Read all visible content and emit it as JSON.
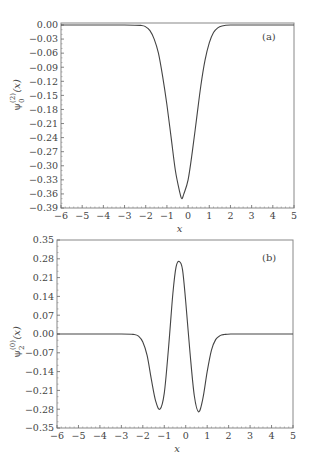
{
  "chart_data": [
    {
      "type": "line",
      "panel_label": "(a)",
      "title": "",
      "xlabel": "x",
      "ylabel": "ψ0(2) (x)",
      "ylabel_main": "ψ",
      "ylabel_sup": "(2)",
      "ylabel_sub": "0",
      "ylabel_arg": "(x)",
      "xlim": [
        -6,
        5
      ],
      "ylim": [
        -0.39,
        0.0
      ],
      "grid": false,
      "x_ticks": [
        -6,
        -5,
        -4,
        -3,
        -2,
        -1,
        0,
        1,
        2,
        3,
        4,
        5
      ],
      "x_tick_labels": [
        "−6",
        "−5",
        "−4",
        "−3",
        "−2",
        "−1",
        "0",
        "1",
        "2",
        "3",
        "4",
        "5"
      ],
      "y_ticks": [
        0.0,
        -0.03,
        -0.06,
        -0.09,
        -0.12,
        -0.15,
        -0.18,
        -0.21,
        -0.24,
        -0.27,
        -0.3,
        -0.33,
        -0.36,
        -0.39
      ],
      "y_tick_labels": [
        "0.00",
        "−0.03",
        "−0.06",
        "−0.09",
        "−0.12",
        "−0.15",
        "−0.18",
        "−0.21",
        "−0.24",
        "−0.27",
        "−0.30",
        "−0.33",
        "−0.36",
        "−0.39"
      ],
      "series": [
        {
          "name": "psi0_2",
          "x": [
            -6,
            -3,
            -2.2,
            -2.0,
            -1.8,
            -1.6,
            -1.4,
            -1.2,
            -1.0,
            -0.8,
            -0.6,
            -0.4,
            -0.3,
            -0.2,
            0.0,
            0.2,
            0.4,
            0.6,
            0.8,
            1.0,
            1.2,
            1.4,
            1.6,
            2.0,
            3,
            5
          ],
          "y": [
            0.0,
            0.0,
            -0.001,
            -0.004,
            -0.012,
            -0.03,
            -0.06,
            -0.11,
            -0.17,
            -0.24,
            -0.31,
            -0.355,
            -0.37,
            -0.36,
            -0.33,
            -0.27,
            -0.2,
            -0.13,
            -0.075,
            -0.038,
            -0.016,
            -0.006,
            -0.002,
            0.0,
            0.0,
            0.0
          ]
        }
      ]
    },
    {
      "type": "line",
      "panel_label": "(b)",
      "title": "",
      "xlabel": "x",
      "ylabel": "ψ2(0) (x)",
      "ylabel_main": "ψ",
      "ylabel_sup": "(0)",
      "ylabel_sub": "2",
      "ylabel_arg": "(x)",
      "xlim": [
        -6,
        5
      ],
      "ylim": [
        -0.35,
        0.35
      ],
      "grid": false,
      "x_ticks": [
        -6,
        -5,
        -4,
        -3,
        -2,
        -1,
        0,
        1,
        2,
        3,
        4,
        5
      ],
      "x_tick_labels": [
        "−6",
        "−5",
        "−4",
        "−3",
        "−2",
        "−1",
        "0",
        "1",
        "2",
        "3",
        "4",
        "5"
      ],
      "y_ticks": [
        0.35,
        0.28,
        0.21,
        0.14,
        0.07,
        0.0,
        -0.07,
        -0.14,
        -0.21,
        -0.28,
        -0.35
      ],
      "y_tick_labels": [
        "0.35",
        "0.28",
        "0.21",
        "0.14",
        "0.07",
        "0.00",
        "−0.07",
        "−0.14",
        "−0.21",
        "−0.28",
        "−0.35"
      ],
      "series": [
        {
          "name": "psi2_0",
          "x": [
            -6,
            -3,
            -2.4,
            -2.2,
            -2.0,
            -1.8,
            -1.6,
            -1.4,
            -1.2,
            -1.0,
            -0.8,
            -0.6,
            -0.45,
            -0.3,
            -0.15,
            0.0,
            0.2,
            0.4,
            0.6,
            0.8,
            1.0,
            1.2,
            1.4,
            1.6,
            1.8,
            2.1,
            3,
            5
          ],
          "y": [
            0.0,
            0.0,
            -0.002,
            -0.008,
            -0.03,
            -0.08,
            -0.17,
            -0.25,
            -0.28,
            -0.22,
            -0.05,
            0.15,
            0.25,
            0.27,
            0.24,
            0.12,
            -0.07,
            -0.23,
            -0.29,
            -0.24,
            -0.14,
            -0.06,
            -0.02,
            -0.006,
            -0.002,
            0.0,
            0.0,
            0.0
          ]
        }
      ]
    }
  ]
}
